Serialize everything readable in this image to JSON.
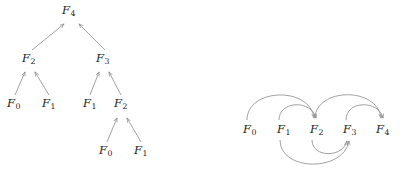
{
  "figure": {
    "width": 403,
    "height": 178,
    "background": "#ffffff",
    "line_color": "#8a8a8a",
    "text_color": "#1a1a1a"
  },
  "recursion_tree": {
    "title": "",
    "nodes": [
      {
        "id": "t-f4",
        "label": "F",
        "subscript": "4",
        "x": 62,
        "y": 5
      },
      {
        "id": "t-f2a",
        "label": "F",
        "subscript": "2",
        "x": 22,
        "y": 53
      },
      {
        "id": "t-f3",
        "label": "F",
        "subscript": "3",
        "x": 96,
        "y": 53
      },
      {
        "id": "t-f0a",
        "label": "F",
        "subscript": "0",
        "x": 7,
        "y": 98
      },
      {
        "id": "t-f1a",
        "label": "F",
        "subscript": "1",
        "x": 42,
        "y": 98
      },
      {
        "id": "t-f1b",
        "label": "F",
        "subscript": "1",
        "x": 83,
        "y": 98
      },
      {
        "id": "t-f2b",
        "label": "F",
        "subscript": "2",
        "x": 114,
        "y": 98
      },
      {
        "id": "t-f0b",
        "label": "F",
        "subscript": "0",
        "x": 99,
        "y": 145
      },
      {
        "id": "t-f1c",
        "label": "F",
        "subscript": "1",
        "x": 134,
        "y": 145
      }
    ],
    "edges": [
      {
        "from": "t-f2a",
        "to": "t-f4",
        "arrow": true
      },
      {
        "from": "t-f3",
        "to": "t-f4",
        "arrow": true
      },
      {
        "from": "t-f0a",
        "to": "t-f2a",
        "arrow": true
      },
      {
        "from": "t-f1a",
        "to": "t-f2a",
        "arrow": true
      },
      {
        "from": "t-f1b",
        "to": "t-f3",
        "arrow": true
      },
      {
        "from": "t-f2b",
        "to": "t-f3",
        "arrow": true
      },
      {
        "from": "t-f0b",
        "to": "t-f2b",
        "arrow": true
      },
      {
        "from": "t-f1c",
        "to": "t-f2b",
        "arrow": true
      }
    ]
  },
  "dependency_dag": {
    "title": "",
    "nodes": [
      {
        "id": "d-f0",
        "label": "F",
        "subscript": "0",
        "x": 43,
        "y": 124
      },
      {
        "id": "d-f1",
        "label": "F",
        "subscript": "1",
        "x": 77,
        "y": 124
      },
      {
        "id": "d-f2",
        "label": "F",
        "subscript": "2",
        "x": 110,
        "y": 124
      },
      {
        "id": "d-f3",
        "label": "F",
        "subscript": "3",
        "x": 143,
        "y": 124
      },
      {
        "id": "d-f4",
        "label": "F",
        "subscript": "4",
        "x": 176,
        "y": 124
      }
    ],
    "edges": [
      {
        "from": "d-f0",
        "to": "d-f2",
        "side": "above",
        "arrow": true
      },
      {
        "from": "d-f1",
        "to": "d-f2",
        "side": "above",
        "arrow": true
      },
      {
        "from": "d-f2",
        "to": "d-f4",
        "side": "above",
        "arrow": true
      },
      {
        "from": "d-f3",
        "to": "d-f4",
        "side": "above",
        "arrow": true
      },
      {
        "from": "d-f1",
        "to": "d-f3",
        "side": "below",
        "arrow": true
      },
      {
        "from": "d-f2",
        "to": "d-f3",
        "side": "below",
        "arrow": true
      }
    ]
  }
}
